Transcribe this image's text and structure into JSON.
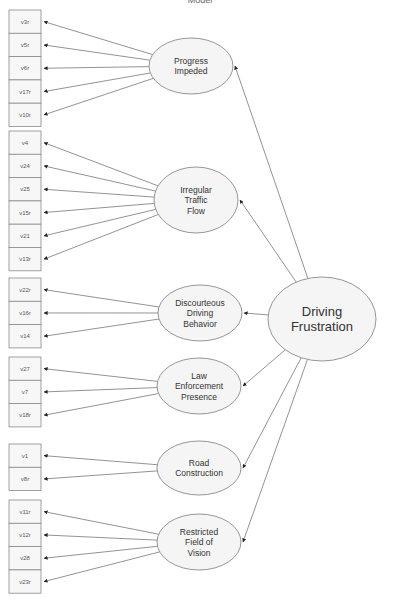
{
  "diagram": {
    "title_partial": "Model",
    "second_order_factor": {
      "label_lines": [
        "Driving",
        "Frustration"
      ],
      "cx": 322,
      "cy": 319,
      "rx": 54,
      "ry": 42
    },
    "factors": [
      {
        "id": "progress-impeded",
        "label_lines": [
          "Progress",
          "Impeded"
        ],
        "cx": 191,
        "cy": 66,
        "rx": 42,
        "ry": 28,
        "indicators": [
          "v3r",
          "v5r",
          "v6r",
          "v17r",
          "v10r"
        ],
        "box_top": 10
      },
      {
        "id": "irregular-traffic-flow",
        "label_lines": [
          "Irregular",
          "Traffic",
          "Flow"
        ],
        "cx": 196,
        "cy": 200,
        "rx": 42,
        "ry": 33,
        "indicators": [
          "v4",
          "v24",
          "v25",
          "v15r",
          "v21",
          "v13r"
        ],
        "box_top": 131
      },
      {
        "id": "discourteous-driving-behavior",
        "label_lines": [
          "Discourteous",
          "Driving",
          "Behavior"
        ],
        "cx": 200,
        "cy": 313,
        "rx": 42,
        "ry": 28,
        "indicators": [
          "v22r",
          "v16r",
          "v14"
        ],
        "box_top": 278
      },
      {
        "id": "law-enforcement-presence",
        "label_lines": [
          "Law",
          "Enforcement",
          "Presence"
        ],
        "cx": 199,
        "cy": 386,
        "rx": 42,
        "ry": 28,
        "indicators": [
          "v27",
          "v7",
          "v18r"
        ],
        "box_top": 357
      },
      {
        "id": "road-construction",
        "label_lines": [
          "Road",
          "Construction"
        ],
        "cx": 199,
        "cy": 468,
        "rx": 42,
        "ry": 27,
        "indicators": [
          "v1",
          "v8r"
        ],
        "box_top": 444
      },
      {
        "id": "restricted-field-of-vision",
        "label_lines": [
          "Restricted",
          "Field of",
          "Vision"
        ],
        "cx": 199,
        "cy": 542,
        "rx": 42,
        "ry": 28,
        "indicators": [
          "v11r",
          "v12r",
          "v28",
          "v23r"
        ],
        "box_top": 500
      }
    ],
    "box": {
      "x": 9,
      "width": 32,
      "height": 23.3
    },
    "colors": {
      "stroke": "#8a8a8a",
      "edge": "#777777",
      "fill": "#f5f5f5",
      "text": "#333333"
    }
  }
}
